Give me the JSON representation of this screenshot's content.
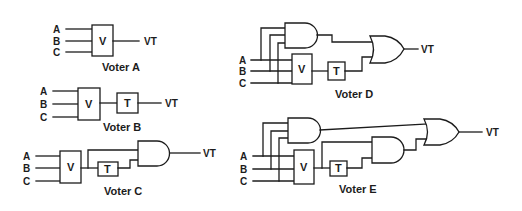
{
  "diagram": {
    "type": "logic-circuit-diagrams",
    "voters": [
      {
        "caption": "Voter A",
        "inputs": [
          "A",
          "B",
          "C"
        ],
        "blocks": [
          "V"
        ],
        "output": "VT"
      },
      {
        "caption": "Voter B",
        "inputs": [
          "A",
          "B",
          "C"
        ],
        "blocks": [
          "V",
          "T"
        ],
        "output": "VT"
      },
      {
        "caption": "Voter C",
        "inputs": [
          "A",
          "B",
          "C"
        ],
        "blocks": [
          "V",
          "T"
        ],
        "gates": [
          "AND"
        ],
        "output": "VT"
      },
      {
        "caption": "Voter D",
        "inputs": [
          "A",
          "B",
          "C"
        ],
        "blocks": [
          "V",
          "T"
        ],
        "gates": [
          "AND",
          "OR"
        ],
        "output": "VT"
      },
      {
        "caption": "Voter E",
        "inputs": [
          "A",
          "B",
          "C"
        ],
        "blocks": [
          "V",
          "T"
        ],
        "gates": [
          "AND",
          "AND",
          "OR"
        ],
        "output": "VT"
      }
    ]
  }
}
